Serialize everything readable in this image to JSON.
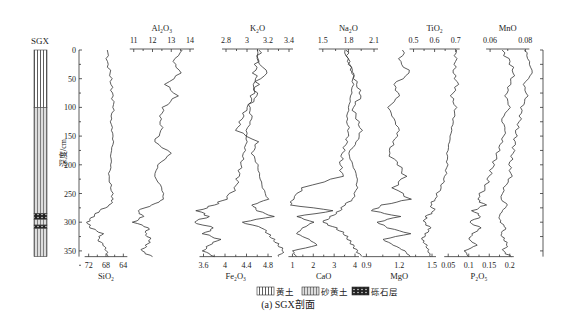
{
  "caption": "(a) SGX剖面",
  "section_label": "SGX",
  "depth_axis": {
    "label": "深度/cm",
    "ticks": [
      0,
      50,
      100,
      150,
      200,
      250,
      300,
      350
    ],
    "range": [
      0,
      360
    ]
  },
  "legend": [
    {
      "pattern": "loess",
      "label": "黄土"
    },
    {
      "pattern": "sandy-loess",
      "label": "砂黄土"
    },
    {
      "pattern": "gravel",
      "label": "砾石层"
    }
  ],
  "stratigraphy": [
    {
      "type": "loess",
      "top": 0,
      "bottom": 100
    },
    {
      "type": "sandy-loess",
      "top": 100,
      "bottom": 285
    },
    {
      "type": "gravel",
      "top": 285,
      "bottom": 295
    },
    {
      "type": "sandy-loess",
      "top": 295,
      "bottom": 305
    },
    {
      "type": "gravel",
      "top": 305,
      "bottom": 311
    },
    {
      "type": "sandy-loess",
      "top": 311,
      "bottom": 360
    }
  ],
  "chart_data": {
    "type": "line",
    "title": "(a) SGX剖面",
    "ylabel": "深度/cm",
    "ylim": [
      0,
      360
    ],
    "y_inverted": true,
    "depth": [
      0,
      20,
      40,
      60,
      80,
      100,
      120,
      140,
      160,
      180,
      200,
      220,
      240,
      260,
      270,
      280,
      290,
      300,
      310,
      320,
      330,
      340,
      350,
      360
    ],
    "series": [
      {
        "name": "SiO2",
        "axis": "bottom",
        "xlabel": "SiO₂",
        "ticks": [
          72,
          68,
          64
        ],
        "reversed": true,
        "values": [
          67.5,
          67.8,
          67.0,
          66.8,
          66.5,
          66.2,
          66.9,
          66.6,
          66.3,
          66.9,
          66.8,
          67.4,
          66.8,
          66.4,
          67.0,
          69.5,
          71.0,
          72.3,
          71.5,
          68.8,
          69.9,
          68.5,
          67.9,
          67.5
        ]
      },
      {
        "name": "Al2O3",
        "axis": "top",
        "xlabel": "Al₂O₃",
        "ticks": [
          11,
          12,
          13,
          14
        ],
        "values": [
          13.6,
          13.1,
          13.5,
          12.7,
          13.3,
          12.6,
          12.4,
          12.5,
          12.1,
          13.0,
          12.3,
          12.1,
          12.5,
          12.6,
          12.0,
          11.2,
          11.5,
          11.0,
          11.8,
          11.6,
          11.9,
          11.7,
          11.4,
          12.0
        ]
      },
      {
        "name": "Fe2O3",
        "axis": "bottom",
        "xlabel": "Fe₂O₃",
        "ticks": [
          3.6,
          4.0,
          4.4,
          4.8
        ],
        "values": [
          4.65,
          4.6,
          4.55,
          4.6,
          4.5,
          4.45,
          4.5,
          4.4,
          4.4,
          4.35,
          4.3,
          4.25,
          4.2,
          4.0,
          3.8,
          3.5,
          3.7,
          3.4,
          3.8,
          3.6,
          3.9,
          3.7,
          3.6,
          3.8
        ]
      },
      {
        "name": "K2O",
        "axis": "top",
        "xlabel": "K₂O",
        "ticks": [
          2.8,
          3.0,
          3.2,
          3.4
        ],
        "values": [
          3.1,
          3.1,
          3.2,
          3.05,
          3.1,
          3.0,
          2.95,
          2.9,
          3.1,
          3.05,
          3.1,
          3.12,
          3.15,
          3.2,
          3.05,
          3.1,
          3.25,
          2.95,
          3.15,
          3.2,
          3.25,
          3.3,
          3.35,
          3.3
        ]
      },
      {
        "name": "CaO",
        "axis": "bottom",
        "xlabel": "CaO",
        "ticks": [
          1,
          2,
          3,
          4
        ],
        "values": [
          3.6,
          3.7,
          3.9,
          3.9,
          3.8,
          3.7,
          3.6,
          3.7,
          3.6,
          3.4,
          3.3,
          3.4,
          1.5,
          1.0,
          0.9,
          3.0,
          1.2,
          2.0,
          1.5,
          1.2,
          1.8,
          2.2,
          1.0,
          1.2
        ]
      },
      {
        "name": "Na2O",
        "axis": "top",
        "xlabel": "Na₂O",
        "ticks": [
          1.5,
          1.8,
          2.1
        ],
        "values": [
          1.75,
          1.8,
          1.85,
          1.9,
          1.95,
          1.85,
          1.9,
          1.95,
          1.9,
          1.8,
          1.85,
          1.9,
          1.9,
          1.85,
          1.75,
          1.7,
          1.6,
          1.5,
          1.65,
          1.75,
          1.8,
          1.85,
          1.9,
          1.95
        ]
      },
      {
        "name": "MgO",
        "axis": "bottom",
        "xlabel": "MgO",
        "ticks": [
          0.9,
          1.2,
          1.5
        ],
        "values": [
          1.25,
          1.2,
          1.3,
          1.15,
          1.2,
          1.1,
          1.15,
          1.2,
          1.15,
          1.1,
          1.2,
          1.25,
          1.15,
          1.3,
          1.05,
          0.95,
          1.2,
          1.0,
          1.1,
          1.3,
          1.05,
          1.15,
          1.25,
          1.3
        ]
      },
      {
        "name": "TiO2",
        "axis": "top",
        "xlabel": "TiO₂",
        "ticks": [
          0.5,
          0.6,
          0.7
        ],
        "values": [
          0.7,
          0.7,
          0.69,
          0.71,
          0.68,
          0.7,
          0.69,
          0.68,
          0.67,
          0.66,
          0.66,
          0.65,
          0.63,
          0.6,
          0.58,
          0.6,
          0.56,
          0.55,
          0.58,
          0.56,
          0.54,
          0.56,
          0.57,
          0.58
        ]
      },
      {
        "name": "P2O5",
        "axis": "bottom",
        "xlabel": "P₂O₅",
        "ticks": [
          0.05,
          0.1,
          0.15,
          0.2
        ],
        "values": [
          0.18,
          0.2,
          0.21,
          0.2,
          0.19,
          0.2,
          0.18,
          0.19,
          0.18,
          0.17,
          0.16,
          0.15,
          0.14,
          0.12,
          0.14,
          0.11,
          0.13,
          0.1,
          0.13,
          0.11,
          0.1,
          0.12,
          0.09,
          0.1
        ]
      },
      {
        "name": "MnO",
        "axis": "top",
        "xlabel": "MnO",
        "ticks": [
          0.06,
          0.08
        ],
        "values": [
          0.08,
          0.082,
          0.084,
          0.079,
          0.081,
          0.078,
          0.077,
          0.075,
          0.074,
          0.073,
          0.071,
          0.072,
          0.068,
          0.066,
          0.07,
          0.067,
          0.065,
          0.066,
          0.069,
          0.066,
          0.068,
          0.07,
          0.067,
          0.072
        ]
      }
    ]
  }
}
